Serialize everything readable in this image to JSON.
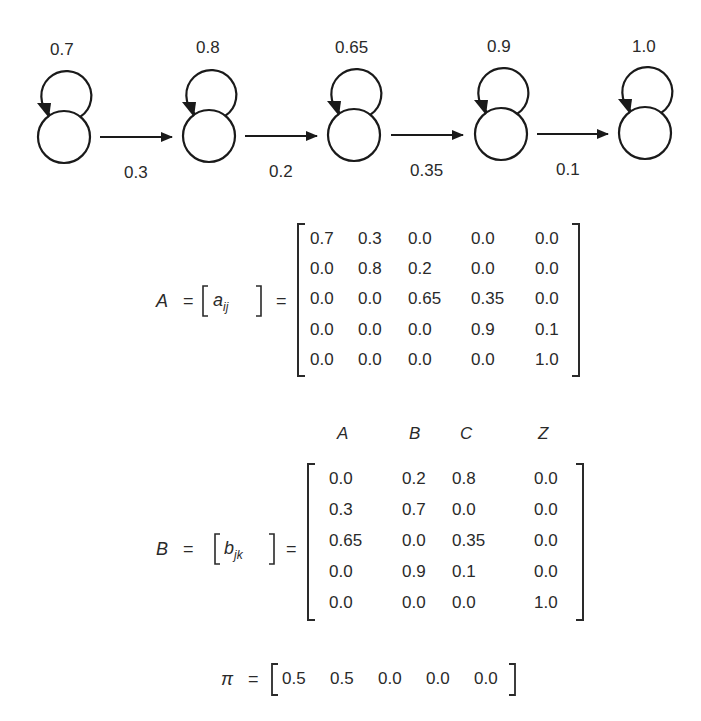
{
  "diagram": {
    "states": [
      {
        "id": 1,
        "self_loop": "0.7"
      },
      {
        "id": 2,
        "self_loop": "0.8"
      },
      {
        "id": 3,
        "self_loop": "0.65"
      },
      {
        "id": 4,
        "self_loop": "0.9"
      },
      {
        "id": 5,
        "self_loop": "1.0"
      }
    ],
    "transitions": [
      {
        "from": 1,
        "to": 2,
        "label": "0.3"
      },
      {
        "from": 2,
        "to": 3,
        "label": "0.2"
      },
      {
        "from": 3,
        "to": 4,
        "label": "0.35"
      },
      {
        "from": 4,
        "to": 5,
        "label": "0.1"
      }
    ]
  },
  "matrix_a": {
    "lhs": "A",
    "eq1": "=",
    "elem": "a",
    "elem_sub": "ij",
    "eq2": "=",
    "rows": [
      [
        "0.7",
        "0.3",
        "0.0",
        "0.0",
        "0.0"
      ],
      [
        "0.0",
        "0.8",
        "0.2",
        "0.0",
        "0.0"
      ],
      [
        "0.0",
        "0.0",
        "0.65",
        "0.35",
        "0.0"
      ],
      [
        "0.0",
        "0.0",
        "0.0",
        "0.9",
        "0.1"
      ],
      [
        "0.0",
        "0.0",
        "0.0",
        "0.0",
        "1.0"
      ]
    ]
  },
  "matrix_b": {
    "lhs": "B",
    "eq1": "=",
    "elem": "b",
    "elem_sub": "jk",
    "eq2": "=",
    "col_headers": [
      "A",
      "B",
      "C",
      "Z"
    ],
    "rows": [
      [
        "0.0",
        "0.2",
        "0.8",
        "0.0"
      ],
      [
        "0.3",
        "0.7",
        "0.0",
        "0.0"
      ],
      [
        "0.65",
        "0.0",
        "0.35",
        "0.0"
      ],
      [
        "0.0",
        "0.9",
        "0.1",
        "0.0"
      ],
      [
        "0.0",
        "0.0",
        "0.0",
        "1.0"
      ]
    ]
  },
  "pi": {
    "lhs": "π",
    "eq": "=",
    "values": [
      "0.5",
      "0.5",
      "0.0",
      "0.0",
      "0.0"
    ]
  }
}
